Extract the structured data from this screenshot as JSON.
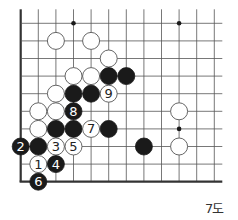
{
  "diagram": {
    "type": "go-board-problem",
    "caption": "7도",
    "grid": {
      "origin_x": 20.7,
      "origin_y": 23.3,
      "spacing": 17.6,
      "cols": 12,
      "rows": 10,
      "left_edge": true,
      "bottom_edge": true,
      "top_open": true,
      "right_open": true
    },
    "colors": {
      "line": "#555555",
      "edge": "#333333",
      "black_stone": "#1a1a1a",
      "white_stone": "#ffffff",
      "white_stroke": "#555555",
      "star": "#1a1a1a"
    },
    "star_points": [
      {
        "col": 3,
        "row": 0
      },
      {
        "col": 9,
        "row": 0
      },
      {
        "col": 9,
        "row": 6
      }
    ],
    "stones": [
      {
        "color": "white",
        "col": 2,
        "row": 1,
        "label": ""
      },
      {
        "color": "white",
        "col": 4,
        "row": 1,
        "label": ""
      },
      {
        "color": "white",
        "col": 5,
        "row": 2,
        "label": ""
      },
      {
        "color": "white",
        "col": 3,
        "row": 3,
        "label": ""
      },
      {
        "color": "white",
        "col": 4,
        "row": 3,
        "label": ""
      },
      {
        "color": "black",
        "col": 5,
        "row": 3,
        "label": ""
      },
      {
        "color": "black",
        "col": 6,
        "row": 3,
        "label": ""
      },
      {
        "color": "white",
        "col": 2,
        "row": 4,
        "label": ""
      },
      {
        "color": "black",
        "col": 3,
        "row": 4,
        "label": ""
      },
      {
        "color": "black",
        "col": 4,
        "row": 4,
        "label": ""
      },
      {
        "color": "white",
        "col": 5,
        "row": 4,
        "label": "9"
      },
      {
        "color": "white",
        "col": 1,
        "row": 5,
        "label": ""
      },
      {
        "color": "white",
        "col": 2,
        "row": 5,
        "label": ""
      },
      {
        "color": "black",
        "col": 3,
        "row": 5,
        "label": "8"
      },
      {
        "color": "white",
        "col": 9,
        "row": 5,
        "label": ""
      },
      {
        "color": "white",
        "col": 1,
        "row": 6,
        "label": ""
      },
      {
        "color": "black",
        "col": 2,
        "row": 6,
        "label": ""
      },
      {
        "color": "black",
        "col": 3,
        "row": 6,
        "label": ""
      },
      {
        "color": "white",
        "col": 4,
        "row": 6,
        "label": "7"
      },
      {
        "color": "black",
        "col": 5,
        "row": 6,
        "label": ""
      },
      {
        "color": "black",
        "col": 0,
        "row": 7,
        "label": "2"
      },
      {
        "color": "black",
        "col": 1,
        "row": 7,
        "label": ""
      },
      {
        "color": "white",
        "col": 2,
        "row": 7,
        "label": "3"
      },
      {
        "color": "white",
        "col": 3,
        "row": 7,
        "label": "5"
      },
      {
        "color": "black",
        "col": 7,
        "row": 7,
        "label": ""
      },
      {
        "color": "white",
        "col": 9,
        "row": 7,
        "label": ""
      },
      {
        "color": "white",
        "col": 1,
        "row": 8,
        "label": "1"
      },
      {
        "color": "black",
        "col": 2,
        "row": 8,
        "label": "4"
      },
      {
        "color": "black",
        "col": 1,
        "row": 9,
        "label": "6"
      }
    ]
  }
}
